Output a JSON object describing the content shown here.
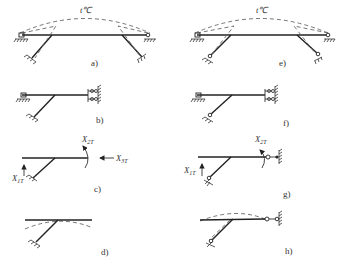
{
  "figure": {
    "panels": [
      {
        "id": "a",
        "label": "a)",
        "temperature_label": "t℃"
      },
      {
        "id": "b",
        "label": "b)"
      },
      {
        "id": "c",
        "label": "c)",
        "symbols": [
          "X2T",
          "X3T",
          "X1T"
        ]
      },
      {
        "id": "d",
        "label": "d)"
      },
      {
        "id": "e",
        "label": "e)",
        "temperature_label": "t℃"
      },
      {
        "id": "f",
        "label": "f)"
      },
      {
        "id": "g",
        "label": "g)",
        "symbols": [
          "X2T",
          "X1T"
        ]
      },
      {
        "id": "h",
        "label": "h)"
      }
    ],
    "text": {
      "a_temp": "t℃",
      "e_temp": "t℃",
      "a": "a)",
      "b": "b)",
      "c": "c)",
      "d": "d)",
      "e": "e)",
      "f": "f)",
      "g": "g)",
      "h": "h)",
      "c_x2": "X",
      "c_x2_sub": "2T",
      "c_x3": "X",
      "c_x3_sub": "3T",
      "c_x1": "X",
      "c_x1_sub": "1T",
      "g_x2": "X",
      "g_x2_sub": "2T",
      "g_x1": "X",
      "g_x1_sub": "1T"
    }
  }
}
